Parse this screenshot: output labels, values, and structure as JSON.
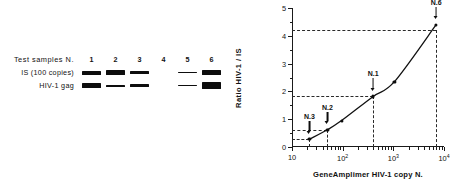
{
  "gel": {
    "header_label": "Test  samples  N.",
    "lane_numbers": [
      "1",
      "2",
      "3",
      "4",
      "5",
      "6"
    ],
    "rows": [
      {
        "label": "IS (100   copies)",
        "bands": [
          {
            "lane": "1",
            "thickness": 4.0,
            "present": true
          },
          {
            "lane": "2",
            "thickness": 4.6,
            "present": true
          },
          {
            "lane": "3",
            "thickness": 3.6,
            "present": true
          },
          {
            "lane": "4",
            "thickness": 0,
            "present": false
          },
          {
            "lane": "5",
            "thickness": 1.6,
            "present": true
          },
          {
            "lane": "6",
            "thickness": 4.4,
            "present": true
          }
        ]
      },
      {
        "label": "HIV-1   gag",
        "bands": [
          {
            "lane": "1",
            "thickness": 4.8,
            "present": true
          },
          {
            "lane": "2",
            "thickness": 2.0,
            "present": true
          },
          {
            "lane": "3",
            "thickness": 2.2,
            "present": true
          },
          {
            "lane": "4",
            "thickness": 0,
            "present": false
          },
          {
            "lane": "5",
            "thickness": 1.7,
            "present": true
          },
          {
            "lane": "6",
            "thickness": 6.6,
            "present": true
          }
        ]
      }
    ]
  },
  "chart_data": {
    "type": "line",
    "title": "",
    "xlabel": "GeneAmplimer  HIV-1   copy   N.",
    "ylabel": "Ratio  HIV-1  /  IS",
    "xscale": "log",
    "xlim": [
      10,
      10000
    ],
    "ylim": [
      0,
      5
    ],
    "grid": false,
    "legend": null,
    "x_ticks": [
      {
        "value": 10,
        "label": "10",
        "exp": ""
      },
      {
        "value": 100,
        "label": "10",
        "exp": "2"
      },
      {
        "value": 1000,
        "label": "10",
        "exp": "3"
      },
      {
        "value": 10000,
        "label": "10",
        "exp": "4"
      }
    ],
    "y_ticks": [
      0,
      1,
      2,
      3,
      4,
      5
    ],
    "x": [
      22,
      50,
      95,
      400,
      1050,
      7000
    ],
    "y": [
      0.28,
      0.62,
      0.95,
      1.82,
      2.35,
      4.4
    ],
    "points": [
      {
        "x": 22,
        "y": 0.28,
        "annotation": "N.3"
      },
      {
        "x": 50,
        "y": 0.62,
        "annotation": "N.2"
      },
      {
        "x": 95,
        "y": 0.95,
        "annotation": ""
      },
      {
        "x": 400,
        "y": 1.82,
        "annotation": "N.1"
      },
      {
        "x": 1050,
        "y": 2.35,
        "annotation": ""
      },
      {
        "x": 7000,
        "y": 4.4,
        "annotation": "N.6"
      }
    ],
    "guides": [
      {
        "x": 22,
        "y": 0.28
      },
      {
        "x": 50,
        "y": 0.62
      },
      {
        "x": 400,
        "y": 1.82
      },
      {
        "x": 7000,
        "y": 4.2
      }
    ]
  },
  "colors": {
    "band": "#0d0d0d",
    "axis": "#1a1a1a",
    "curve": "#111111",
    "guide": "#2a2a2a"
  }
}
